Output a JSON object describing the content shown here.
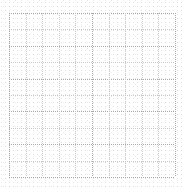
{
  "canvas": {
    "width": 182,
    "height": 187,
    "background_color": "#ffffff",
    "description": "Blank dotted grid sheet"
  },
  "grid": {
    "origin_x": 9,
    "origin_y": 13,
    "cell_width": 16.6,
    "cell_height": 16.4,
    "columns": 10,
    "rows": 10,
    "line_style": "dotted",
    "dot_period_px": 2,
    "major_line_color": "#a9a9ae",
    "minor_line_color": "#c8c8cd",
    "major_every": 1,
    "x_positions": [
      9,
      25.6,
      42.2,
      58.8,
      75.4,
      92,
      108.6,
      125.2,
      141.8,
      158.4,
      175
    ],
    "y_positions": [
      13,
      29.4,
      45.8,
      62.2,
      78.6,
      95,
      111.4,
      127.8,
      144.2,
      160.6,
      177
    ],
    "major_x_positions": [
      9,
      92,
      175
    ],
    "major_y_positions": [
      13,
      45.8,
      78.6,
      111.4,
      144.2,
      177
    ]
  },
  "texture": {
    "enabled": true,
    "color": "#a0a0a5",
    "opacity": 0.3,
    "tile_px": 4
  }
}
